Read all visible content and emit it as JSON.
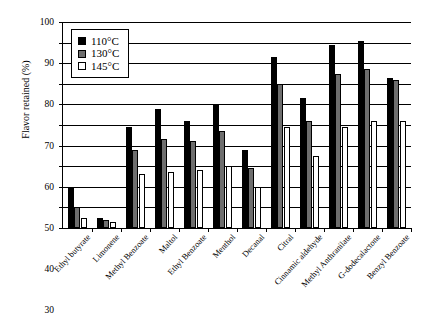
{
  "chart_data": {
    "type": "bar",
    "title": "",
    "xlabel": "",
    "ylabel": "Flavor retained (%)",
    "ylim": [
      0,
      100
    ],
    "ytick_step": 10,
    "yticks": [
      0,
      10,
      20,
      30,
      40,
      50,
      60,
      70,
      80,
      90,
      100
    ],
    "grid": true,
    "legend_position": "top-left",
    "categories": [
      "Ethyl butyrate",
      "Limonene",
      "Methyl Benzoate",
      "Maltol",
      "Ethyl Benzoate",
      "Menthol",
      "Decanal",
      "Citral",
      "Cinnamic aldehyde",
      "Methyl Anthranilate",
      "G-dodecalactone",
      "Benzyl Benzoate"
    ],
    "series": [
      {
        "name": "110°C",
        "color": "#000000",
        "values": [
          20,
          5,
          49,
          58,
          52,
          60,
          38,
          83,
          63,
          89,
          91,
          73
        ]
      },
      {
        "name": "130°C",
        "color": "#6e6e6e",
        "values": [
          10,
          4,
          38,
          43,
          42,
          47,
          29,
          70,
          52,
          75,
          77,
          72
        ]
      },
      {
        "name": "145°C",
        "color": "#ffffff",
        "values": [
          5,
          3,
          26,
          27,
          28,
          30,
          20,
          49,
          35,
          49,
          52,
          52
        ]
      }
    ]
  }
}
